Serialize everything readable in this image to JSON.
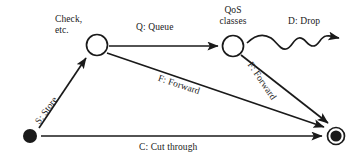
{
  "diagram": {
    "background_color": "#ffffff",
    "ink_color": "#1a1a1a",
    "nodes": [
      {
        "id": "start",
        "name": "start-node",
        "label": "",
        "shape": "filled-circle",
        "cx": 30,
        "cy": 136,
        "r": 7
      },
      {
        "id": "check",
        "name": "check-node",
        "label": "Check,\netc.",
        "shape": "open-circle",
        "cx": 97,
        "cy": 45,
        "r": 11
      },
      {
        "id": "qos",
        "name": "qos-node",
        "label": "QoS\nclasses",
        "shape": "open-circle",
        "cx": 233,
        "cy": 46,
        "r": 11
      },
      {
        "id": "end",
        "name": "end-node",
        "label": "",
        "shape": "double-filled-circle",
        "cx": 336,
        "cy": 136,
        "r": 9
      }
    ],
    "node_labels": {
      "check_line1": "Check,",
      "check_line2": "etc.",
      "qos_line1": "QoS",
      "qos_line2": "classes"
    },
    "edges": [
      {
        "id": "store",
        "name": "edge-store",
        "label": "S: Store",
        "from": "start",
        "to": "check",
        "style": "straight"
      },
      {
        "id": "queue",
        "name": "edge-queue",
        "label": "Q: Queue",
        "from": "check",
        "to": "qos",
        "style": "straight"
      },
      {
        "id": "drop",
        "name": "edge-drop",
        "label": "D: Drop",
        "from": "qos",
        "to": "",
        "style": "wavy"
      },
      {
        "id": "forward1",
        "name": "edge-forward-1",
        "label": "F: Forward",
        "from": "check",
        "to": "end",
        "style": "straight"
      },
      {
        "id": "forward2",
        "name": "edge-forward-2",
        "label": "F: Forward",
        "from": "qos",
        "to": "end",
        "style": "straight"
      },
      {
        "id": "cut",
        "name": "edge-cut",
        "label": "C: Cut through",
        "from": "start",
        "to": "end",
        "style": "straight"
      }
    ]
  }
}
